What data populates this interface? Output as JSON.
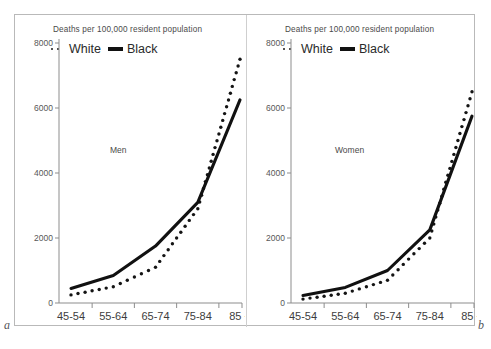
{
  "figure": {
    "corner_labels": {
      "left": "a",
      "right": "b"
    }
  },
  "panels": [
    {
      "key": "men",
      "title": "Deaths per 100,000 resident population",
      "group_label": "Men",
      "legend": [
        {
          "name": "legend-white",
          "label": "White",
          "marker": "dotted"
        },
        {
          "name": "legend-black",
          "label": "Black",
          "marker": "solid"
        }
      ]
    },
    {
      "key": "women",
      "title": "Deaths per 100,000 resident population",
      "group_label": "Women",
      "legend": [
        {
          "name": "legend-white",
          "label": "White",
          "marker": "dotted"
        },
        {
          "name": "legend-black",
          "label": "Black",
          "marker": "solid"
        }
      ]
    }
  ],
  "chart_data": [
    {
      "type": "line",
      "panel": "a",
      "title": "Deaths per 100,000 resident population",
      "annotation": "Men",
      "xlabel": "",
      "ylabel": "",
      "categories": [
        "45-54",
        "55-64",
        "65-74",
        "75-84",
        "85 +"
      ],
      "xticklabels": [
        "45-54",
        "55-64",
        "65-74",
        "75-84",
        "85 +"
      ],
      "yticklabels": [
        "0",
        "2000",
        "4000",
        "6000",
        "8000"
      ],
      "yticks": [
        0,
        2000,
        4000,
        6000,
        8000
      ],
      "ylim": [
        0,
        8000
      ],
      "grid": false,
      "legend_position": "top-left",
      "series": [
        {
          "name": "White",
          "style": "dotted",
          "color": "#141414",
          "values": [
            250,
            500,
            1100,
            2900,
            7500
          ]
        },
        {
          "name": "Black",
          "style": "solid",
          "color": "#111111",
          "values": [
            450,
            850,
            1750,
            3100,
            6250
          ]
        }
      ]
    },
    {
      "type": "line",
      "panel": "b",
      "title": "Deaths per 100,000 resident population",
      "annotation": "Women",
      "xlabel": "",
      "ylabel": "",
      "categories": [
        "45-54",
        "55-64",
        "65-74",
        "75-84",
        "85 +"
      ],
      "xticklabels": [
        "45-54",
        "55-64",
        "65-74",
        "75-84",
        "85 +"
      ],
      "yticklabels": [
        "0",
        "2000",
        "4000",
        "6000",
        "8000"
      ],
      "yticks": [
        0,
        2000,
        4000,
        6000,
        8000
      ],
      "ylim": [
        0,
        8000
      ],
      "grid": false,
      "legend_position": "top-left",
      "series": [
        {
          "name": "White",
          "style": "dotted",
          "color": "#141414",
          "values": [
            120,
            300,
            700,
            2000,
            6500
          ]
        },
        {
          "name": "Black",
          "style": "solid",
          "color": "#111111",
          "values": [
            230,
            480,
            1000,
            2250,
            5750
          ]
        }
      ]
    }
  ]
}
